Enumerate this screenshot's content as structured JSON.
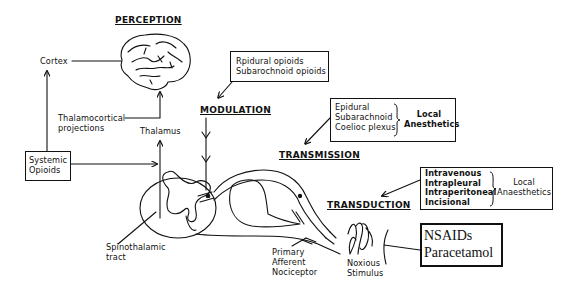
{
  "stages": {
    "perception": "PERCEPTION",
    "modulation": "MODULATION",
    "transmission": "TRANSMISSION",
    "transduction": "TRANSDUCTION"
  },
  "anatomy": {
    "cortex": "Cortex",
    "thalamocortical": [
      "Thalamocortical",
      "projections"
    ],
    "thalamus": "Thalamus",
    "spinothalamic": [
      "Spinothalamic",
      "tract"
    ],
    "primary_afferent": [
      "Primary",
      "Afferent",
      "Nociceptor"
    ],
    "noxious_stimulus": [
      "Noxious",
      "Stimulus"
    ]
  },
  "interventions": {
    "systemic_opioids": [
      "Systemic",
      "Opioids"
    ],
    "neuraxial_opioids": [
      "Rpidural opioids",
      "Subarochnoid opioids"
    ],
    "transmission_block": {
      "routes": [
        "Epidural",
        "Subarachnoid",
        "Coelioc plexus"
      ],
      "agent": [
        "Local",
        "Anesthetics"
      ]
    },
    "transduction_block": {
      "routes": [
        "Intravenous",
        "Intrapleural",
        "Intraperitoneal",
        "Incisional"
      ],
      "agent": [
        "Local",
        "Anaesthetics"
      ]
    },
    "peripheral_agents": [
      "NSAIDs",
      "Paracetamol"
    ]
  }
}
